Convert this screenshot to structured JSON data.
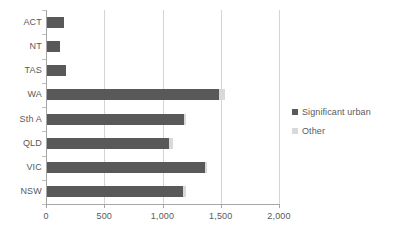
{
  "chart_data": {
    "type": "bar",
    "orientation": "horizontal",
    "title": "",
    "xlabel": "",
    "ylabel": "",
    "xlim": [
      0,
      2000
    ],
    "xticks": [
      0,
      500,
      1000,
      1500,
      2000
    ],
    "xtick_labels": [
      "0",
      "500",
      "1,000",
      "1,500",
      "2,000"
    ],
    "grid": true,
    "grid_axis": "x",
    "legend_position": "right",
    "stacked": true,
    "categories": [
      "ACT",
      "NT",
      "TAS",
      "WA",
      "Sth A",
      "QLD",
      "VIC",
      "NSW"
    ],
    "series": [
      {
        "name": "Significant urban",
        "color": "#595959",
        "values": [
          155,
          120,
          170,
          1485,
          1185,
          1055,
          1365,
          1175
        ]
      },
      {
        "name": "Other",
        "color": "#d9d9d9",
        "values": [
          0,
          0,
          0,
          50,
          15,
          35,
          20,
          25
        ]
      }
    ]
  },
  "legend": {
    "items": [
      {
        "label": "Significant urban",
        "color": "#595959"
      },
      {
        "label": "Other",
        "color": "#d9d9d9"
      }
    ]
  },
  "axis": {
    "x_tick_labels": [
      "0",
      "500",
      "1,000",
      "1,500",
      "2,000"
    ],
    "category_labels": [
      "ACT",
      "NT",
      "TAS",
      "WA",
      "Sth A",
      "QLD",
      "VIC",
      "NSW"
    ]
  }
}
